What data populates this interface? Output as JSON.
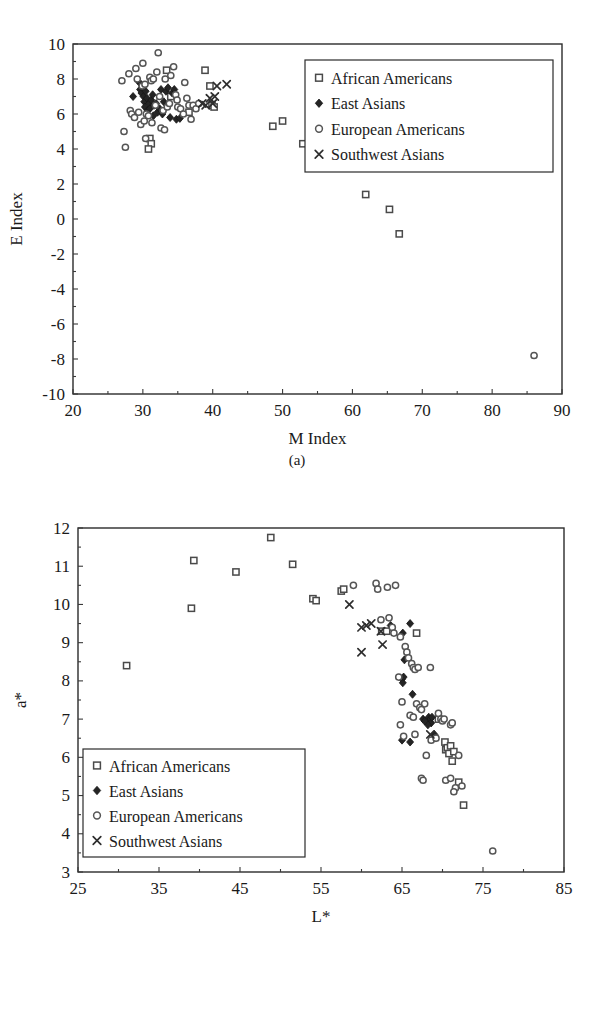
{
  "figure": {
    "panels": [
      {
        "id": "a",
        "caption": "(a)"
      },
      {
        "id": "b",
        "caption": "(b)"
      }
    ]
  },
  "legend": {
    "entries": [
      {
        "label": "African Americans",
        "marker": "open-square"
      },
      {
        "label": "East Asians",
        "marker": "filled-diamond"
      },
      {
        "label": "European Americans",
        "marker": "open-circle"
      },
      {
        "label": "Southwest Asians",
        "marker": "cross-x"
      }
    ]
  },
  "colors": {
    "axis": "#2b2b2b",
    "marker_open_fill": "#ffffff",
    "marker_open_stroke": "#555555",
    "marker_filled": "#242424",
    "background": "#ffffff"
  },
  "chart_data": [
    {
      "type": "scatter",
      "panel": "a",
      "title": "",
      "xlabel": "M Index",
      "ylabel": "E Index",
      "xlim": [
        20,
        90
      ],
      "ylim": [
        -10,
        10
      ],
      "xticks": [
        20,
        30,
        40,
        50,
        60,
        70,
        80,
        90
      ],
      "yticks": [
        -10,
        -8,
        -6,
        -4,
        -2,
        0,
        2,
        4,
        6,
        8,
        10
      ],
      "grid": false,
      "legend_position": "upper-right",
      "series": [
        {
          "name": "African Americans",
          "marker": "open-square",
          "points": [
            [
              31.0,
              4.6
            ],
            [
              31.2,
              4.3
            ],
            [
              30.8,
              4.0
            ],
            [
              33.4,
              8.5
            ],
            [
              34.0,
              7.0
            ],
            [
              36.6,
              6.1
            ],
            [
              38.9,
              8.5
            ],
            [
              39.6,
              7.6
            ],
            [
              39.9,
              6.5
            ],
            [
              40.2,
              6.4
            ],
            [
              48.6,
              5.3
            ],
            [
              50.0,
              5.6
            ],
            [
              52.9,
              4.3
            ],
            [
              61.9,
              1.4
            ],
            [
              65.3,
              0.55
            ],
            [
              66.7,
              -0.85
            ]
          ]
        },
        {
          "name": "East Asians",
          "marker": "filled-diamond",
          "points": [
            [
              28.6,
              7.0
            ],
            [
              29.5,
              7.8
            ],
            [
              29.6,
              7.4
            ],
            [
              29.8,
              7.2
            ],
            [
              30.0,
              7.5
            ],
            [
              30.1,
              7.0
            ],
            [
              30.2,
              6.7
            ],
            [
              30.3,
              6.4
            ],
            [
              30.4,
              7.3
            ],
            [
              30.6,
              6.9
            ],
            [
              30.7,
              6.2
            ],
            [
              30.9,
              6.6
            ],
            [
              31.0,
              6.3
            ],
            [
              31.2,
              6.8
            ],
            [
              31.4,
              7.1
            ],
            [
              31.6,
              6.5
            ],
            [
              31.9,
              6.6
            ],
            [
              32.1,
              6.1
            ],
            [
              32.4,
              6.3
            ],
            [
              32.6,
              7.4
            ],
            [
              33.0,
              6.7
            ],
            [
              33.3,
              7.3
            ],
            [
              33.6,
              7.5
            ],
            [
              33.9,
              5.8
            ],
            [
              34.2,
              7.2
            ],
            [
              34.5,
              7.4
            ],
            [
              34.8,
              5.7
            ],
            [
              35.3,
              5.75
            ],
            [
              32.8,
              6.0
            ],
            [
              31.5,
              5.9
            ]
          ]
        },
        {
          "name": "European Americans",
          "marker": "open-circle",
          "points": [
            [
              27.0,
              7.9
            ],
            [
              27.3,
              5.0
            ],
            [
              27.5,
              4.1
            ],
            [
              28.0,
              8.3
            ],
            [
              28.2,
              6.2
            ],
            [
              28.4,
              6.0
            ],
            [
              28.8,
              5.8
            ],
            [
              29.0,
              8.6
            ],
            [
              29.2,
              8.0
            ],
            [
              29.4,
              6.1
            ],
            [
              29.7,
              5.4
            ],
            [
              30.0,
              8.9
            ],
            [
              30.2,
              5.6
            ],
            [
              30.4,
              4.6
            ],
            [
              30.5,
              6.0
            ],
            [
              30.8,
              5.9
            ],
            [
              31.0,
              8.1
            ],
            [
              31.2,
              7.9
            ],
            [
              31.5,
              8.0
            ],
            [
              31.8,
              6.5
            ],
            [
              32.0,
              8.4
            ],
            [
              32.2,
              9.5
            ],
            [
              32.4,
              7.0
            ],
            [
              32.6,
              5.2
            ],
            [
              32.9,
              6.2
            ],
            [
              33.2,
              8.0
            ],
            [
              33.5,
              6.4
            ],
            [
              33.8,
              6.6
            ],
            [
              34.0,
              8.2
            ],
            [
              34.4,
              8.7
            ],
            [
              34.7,
              7.1
            ],
            [
              35.0,
              6.4
            ],
            [
              35.4,
              6.3
            ],
            [
              35.8,
              6.0
            ],
            [
              36.0,
              7.8
            ],
            [
              36.3,
              6.9
            ],
            [
              36.6,
              6.5
            ],
            [
              36.9,
              5.7
            ],
            [
              37.2,
              6.5
            ],
            [
              37.6,
              6.3
            ],
            [
              38.0,
              6.6
            ],
            [
              29.9,
              7.6
            ],
            [
              30.3,
              7.7
            ],
            [
              31.3,
              5.5
            ],
            [
              33.1,
              5.1
            ],
            [
              34.9,
              6.8
            ],
            [
              86.0,
              -7.8
            ]
          ]
        },
        {
          "name": "Southwest Asians",
          "marker": "cross-x",
          "points": [
            [
              38.5,
              6.6
            ],
            [
              39.0,
              6.5
            ],
            [
              39.6,
              6.9
            ],
            [
              40.0,
              6.6
            ],
            [
              40.3,
              7.0
            ],
            [
              40.6,
              7.6
            ],
            [
              42.0,
              7.7
            ]
          ]
        }
      ]
    },
    {
      "type": "scatter",
      "panel": "b",
      "title": "",
      "xlabel": "L*",
      "ylabel": "a*",
      "xlim": [
        25,
        85
      ],
      "ylim": [
        3,
        12
      ],
      "xticks": [
        25,
        35,
        45,
        55,
        65,
        75,
        85
      ],
      "yticks": [
        3,
        4,
        5,
        6,
        7,
        8,
        9,
        10,
        11,
        12
      ],
      "grid": false,
      "legend_position": "lower-left",
      "series": [
        {
          "name": "African Americans",
          "marker": "open-square",
          "points": [
            [
              31.0,
              8.4
            ],
            [
              39.0,
              9.9
            ],
            [
              39.3,
              11.15
            ],
            [
              44.5,
              10.85
            ],
            [
              48.8,
              11.75
            ],
            [
              51.5,
              11.05
            ],
            [
              54.0,
              10.15
            ],
            [
              54.4,
              10.1
            ],
            [
              57.5,
              10.35
            ],
            [
              57.8,
              10.4
            ],
            [
              62.5,
              9.3
            ],
            [
              63.1,
              9.3
            ],
            [
              66.8,
              9.25
            ],
            [
              68.8,
              6.5
            ],
            [
              70.3,
              6.4
            ],
            [
              70.4,
              6.2
            ],
            [
              70.6,
              6.25
            ],
            [
              70.8,
              6.1
            ],
            [
              71.0,
              6.3
            ],
            [
              71.2,
              5.9
            ],
            [
              71.4,
              6.15
            ],
            [
              72.0,
              5.35
            ],
            [
              72.6,
              4.75
            ],
            [
              69.5,
              7.0
            ]
          ]
        },
        {
          "name": "East Asians",
          "marker": "filled-diamond",
          "points": [
            [
              63.6,
              9.45
            ],
            [
              66.0,
              9.5
            ],
            [
              65.1,
              9.25
            ],
            [
              65.3,
              8.55
            ],
            [
              65.0,
              8.05
            ],
            [
              65.1,
              7.95
            ],
            [
              65.2,
              8.1
            ],
            [
              66.3,
              7.65
            ],
            [
              68.3,
              7.05
            ],
            [
              68.4,
              6.95
            ],
            [
              68.5,
              7.0
            ],
            [
              68.6,
              6.9
            ],
            [
              68.7,
              7.05
            ],
            [
              68.2,
              6.85
            ],
            [
              69.0,
              6.6
            ],
            [
              65.0,
              6.45
            ],
            [
              66.0,
              6.4
            ],
            [
              67.6,
              7.0
            ],
            [
              67.8,
              6.95
            ]
          ]
        },
        {
          "name": "European Americans",
          "marker": "open-circle",
          "points": [
            [
              59.0,
              10.5
            ],
            [
              61.8,
              10.55
            ],
            [
              62.0,
              10.4
            ],
            [
              62.4,
              9.6
            ],
            [
              63.4,
              9.65
            ],
            [
              63.8,
              9.4
            ],
            [
              64.0,
              9.25
            ],
            [
              64.8,
              9.15
            ],
            [
              65.4,
              8.9
            ],
            [
              65.6,
              8.75
            ],
            [
              65.8,
              8.6
            ],
            [
              66.2,
              8.45
            ],
            [
              66.4,
              8.35
            ],
            [
              66.6,
              8.3
            ],
            [
              67.0,
              8.35
            ],
            [
              68.5,
              8.35
            ],
            [
              64.6,
              8.1
            ],
            [
              65.0,
              7.45
            ],
            [
              66.8,
              7.4
            ],
            [
              67.2,
              7.3
            ],
            [
              67.4,
              7.25
            ],
            [
              67.8,
              7.4
            ],
            [
              64.8,
              6.85
            ],
            [
              66.0,
              7.1
            ],
            [
              66.4,
              7.05
            ],
            [
              69.5,
              7.15
            ],
            [
              69.8,
              7.0
            ],
            [
              70.0,
              6.95
            ],
            [
              70.2,
              7.0
            ],
            [
              71.0,
              6.85
            ],
            [
              71.2,
              6.9
            ],
            [
              65.2,
              6.55
            ],
            [
              66.6,
              6.6
            ],
            [
              68.6,
              6.45
            ],
            [
              69.2,
              6.5
            ],
            [
              72.0,
              6.05
            ],
            [
              68.0,
              6.05
            ],
            [
              67.4,
              5.45
            ],
            [
              67.6,
              5.4
            ],
            [
              70.4,
              5.4
            ],
            [
              71.0,
              5.45
            ],
            [
              71.6,
              5.2
            ],
            [
              72.4,
              5.25
            ],
            [
              71.4,
              5.1
            ],
            [
              76.2,
              3.55
            ],
            [
              63.2,
              10.45
            ],
            [
              64.2,
              10.5
            ]
          ]
        },
        {
          "name": "Southwest Asians",
          "marker": "cross-x",
          "points": [
            [
              58.5,
              10.0
            ],
            [
              60.0,
              9.4
            ],
            [
              60.6,
              9.45
            ],
            [
              61.2,
              9.5
            ],
            [
              62.4,
              9.3
            ],
            [
              60.0,
              8.75
            ],
            [
              62.6,
              8.95
            ],
            [
              68.5,
              6.6
            ]
          ]
        }
      ]
    }
  ]
}
